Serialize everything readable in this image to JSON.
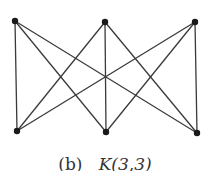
{
  "figure": {
    "caption_prefix": "(b)",
    "caption_graph": "K(3,3)",
    "colors": {
      "edge": "#3a3a3a",
      "node": "#1a1a1a",
      "caption": "#333333"
    }
  },
  "graph": {
    "name": "K(3,3)",
    "type": "complete-bipartite",
    "nodes": [
      {
        "id": "t1",
        "x": 15,
        "y": 21
      },
      {
        "id": "t2",
        "x": 105,
        "y": 22
      },
      {
        "id": "t3",
        "x": 195,
        "y": 22
      },
      {
        "id": "b1",
        "x": 17,
        "y": 131
      },
      {
        "id": "b2",
        "x": 106,
        "y": 132
      },
      {
        "id": "b3",
        "x": 197,
        "y": 133
      }
    ],
    "edges": [
      [
        "t1",
        "b1"
      ],
      [
        "t1",
        "b2"
      ],
      [
        "t1",
        "b3"
      ],
      [
        "t2",
        "b1"
      ],
      [
        "t2",
        "b2"
      ],
      [
        "t2",
        "b3"
      ],
      [
        "t3",
        "b1"
      ],
      [
        "t3",
        "b2"
      ],
      [
        "t3",
        "b3"
      ]
    ]
  }
}
